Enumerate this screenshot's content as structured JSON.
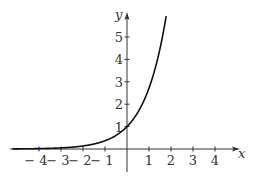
{
  "chart_data": {
    "type": "line",
    "title": "",
    "function": "y = e^x",
    "xlabel": "x",
    "ylabel": "y",
    "xlim": [
      -5.2,
      5
    ],
    "ylim": [
      -1,
      6
    ],
    "x_ticks": [
      -4,
      -3,
      -2,
      -1,
      1,
      2,
      3,
      4
    ],
    "x_tick_labels": [
      "− 4",
      "− 3",
      "− 2",
      "− 1",
      "1",
      "2",
      "3",
      "4"
    ],
    "y_ticks": [
      1,
      2,
      3,
      4,
      5
    ],
    "y_tick_labels": [
      "1",
      "2",
      "3",
      "4",
      "5"
    ],
    "grid": false,
    "legend": null,
    "series": [
      {
        "name": "e^x",
        "x": [
          -5,
          -4,
          -3,
          -2,
          -1,
          0,
          0.5,
          1,
          1.5,
          1.75
        ],
        "y": [
          0.007,
          0.018,
          0.05,
          0.135,
          0.368,
          1,
          1.649,
          2.718,
          4.482,
          5.755
        ]
      }
    ],
    "color": "#111111"
  }
}
